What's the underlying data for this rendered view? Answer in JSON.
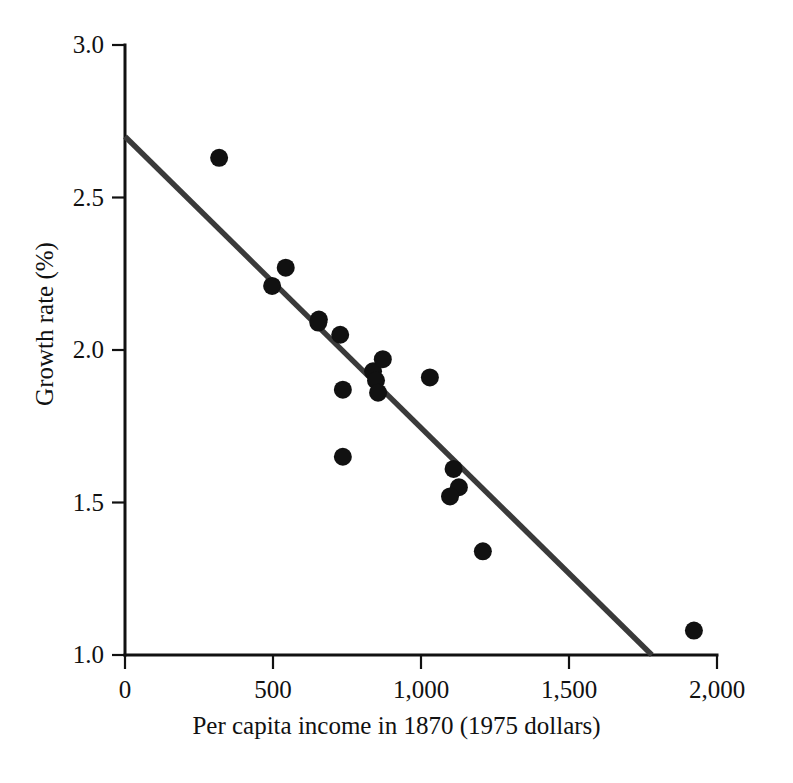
{
  "chart_data": {
    "type": "scatter",
    "title": "",
    "xlabel": "Per capita income in 1870 (1975 dollars)",
    "ylabel": "Growth rate (%)",
    "xlim": [
      0,
      2000
    ],
    "ylim": [
      1.0,
      3.0
    ],
    "grid": false,
    "legend": null,
    "xticks": [
      0,
      500,
      1000,
      1500,
      2000
    ],
    "xtick_labels": [
      "0",
      "500",
      "1,000",
      "1,500",
      "2,000"
    ],
    "yticks": [
      1.0,
      1.5,
      2.0,
      2.5,
      3.0
    ],
    "ytick_labels": [
      "1.0",
      "1.5",
      "2.0",
      "2.5",
      "3.0"
    ],
    "marker": "filled-circle",
    "marker_color": "#111111",
    "points": [
      {
        "x": 318,
        "y": 2.63
      },
      {
        "x": 497,
        "y": 2.21
      },
      {
        "x": 543,
        "y": 2.27
      },
      {
        "x": 655,
        "y": 2.1
      },
      {
        "x": 653,
        "y": 2.09
      },
      {
        "x": 727,
        "y": 2.05
      },
      {
        "x": 736,
        "y": 1.87
      },
      {
        "x": 736,
        "y": 1.65
      },
      {
        "x": 838,
        "y": 1.93
      },
      {
        "x": 848,
        "y": 1.9
      },
      {
        "x": 855,
        "y": 1.86
      },
      {
        "x": 871,
        "y": 1.97
      },
      {
        "x": 1030,
        "y": 1.91
      },
      {
        "x": 1110,
        "y": 1.61
      },
      {
        "x": 1128,
        "y": 1.55
      },
      {
        "x": 1098,
        "y": 1.52
      },
      {
        "x": 1209,
        "y": 1.34
      },
      {
        "x": 1922,
        "y": 1.08
      }
    ],
    "fit_line": {
      "name": "regression line",
      "color": "#3a3a3a",
      "x_start": 0,
      "y_start": 2.7,
      "x_end": 1780,
      "y_end": 1.0
    }
  },
  "axes": {
    "y_title": "Growth rate (%)",
    "x_title": "Per capita income in 1870 (1975 dollars)"
  }
}
